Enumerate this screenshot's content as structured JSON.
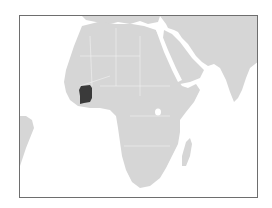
{
  "map": {
    "type": "locator-map",
    "region": "Africa",
    "highlighted_country": "Côte d'Ivoire",
    "colors": {
      "land": "#d6d6d6",
      "highlight": "#3a3a3a",
      "water": "#ffffff",
      "border": "#6e6e6e",
      "country_lines": "#f2f2f2"
    }
  }
}
